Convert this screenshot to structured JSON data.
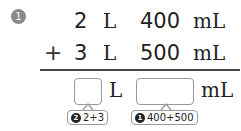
{
  "problem": {
    "number": "1",
    "row1": {
      "liters": "2",
      "l_unit": "L",
      "milliliters": "400",
      "ml_unit": "mL"
    },
    "row2": {
      "operator": "+",
      "liters": "3",
      "l_unit": "L",
      "milliliters": "500",
      "ml_unit": "mL"
    },
    "answer": {
      "l_unit": "L",
      "ml_unit": "mL",
      "liters_value": "",
      "milliliters_value": ""
    },
    "hints": {
      "liters": {
        "step": "2",
        "text": "2+3"
      },
      "milliliters": {
        "step": "1",
        "text": "400+500"
      }
    }
  }
}
